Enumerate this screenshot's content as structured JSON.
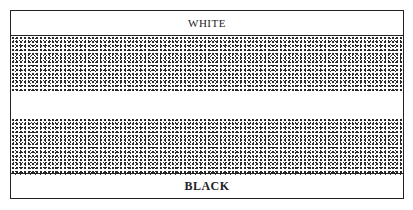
{
  "diagram": {
    "top_label": "WHITE",
    "bottom_label": "BLACK",
    "regions": [
      {
        "name": "white-label-band",
        "fill": "white"
      },
      {
        "name": "upper-stippled-band",
        "fill": "stipple"
      },
      {
        "name": "middle-white-gap",
        "fill": "white"
      },
      {
        "name": "lower-stippled-band",
        "fill": "stipple"
      },
      {
        "name": "black-label-band",
        "fill": "white"
      }
    ]
  }
}
